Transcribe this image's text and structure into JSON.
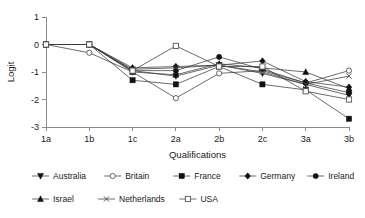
{
  "chart_data": {
    "type": "line",
    "title": "",
    "xlabel": "Qualifications",
    "ylabel": "Logit",
    "categories": [
      "1a",
      "1b",
      "1c",
      "2a",
      "2b",
      "2c",
      "3a",
      "3b"
    ],
    "ylim": [
      -3,
      1
    ],
    "yticks": [
      1,
      0,
      -1,
      -2,
      -3
    ],
    "ytick_labels": [
      "1",
      "0",
      "-1",
      "-2",
      "-3"
    ],
    "grid": false,
    "legend_position": "bottom",
    "series": [
      {
        "name": "Australia",
        "marker": "triangle-down-filled",
        "values": [
          0.0,
          0.0,
          -0.95,
          -1.15,
          -0.75,
          -1.05,
          -1.45,
          -1.85
        ]
      },
      {
        "name": "Britain",
        "marker": "circle-open",
        "values": [
          0.0,
          -0.3,
          -1.0,
          -1.95,
          -1.05,
          -0.95,
          -1.4,
          -0.95
        ]
      },
      {
        "name": "France",
        "marker": "square-filled",
        "values": [
          0.0,
          0.0,
          -1.3,
          -1.45,
          -0.8,
          -1.45,
          -1.65,
          -2.7
        ]
      },
      {
        "name": "Germany",
        "marker": "diamond-filled",
        "values": [
          0.0,
          0.0,
          -0.85,
          -0.8,
          -0.75,
          -0.6,
          -1.35,
          -1.55
        ]
      },
      {
        "name": "Ireland",
        "marker": "circle-filled",
        "values": [
          0.0,
          0.0,
          -0.95,
          -0.95,
          -0.45,
          -0.9,
          -1.4,
          -1.75
        ]
      },
      {
        "name": "Israel",
        "marker": "triangle-up-filled",
        "values": [
          0.0,
          0.0,
          -1.0,
          -1.1,
          -0.7,
          -0.85,
          -1.0,
          -1.6
        ]
      },
      {
        "name": "Netherlands",
        "marker": "cross",
        "values": [
          0.0,
          0.0,
          -0.9,
          -0.85,
          -0.75,
          -1.0,
          -1.45,
          -1.15
        ]
      },
      {
        "name": "USA",
        "marker": "square-open",
        "values": [
          0.0,
          0.0,
          -0.95,
          -0.05,
          -0.8,
          -0.8,
          -1.7,
          -2.0
        ]
      }
    ]
  },
  "legend": {
    "rows": [
      [
        "Australia",
        "Britain",
        "France",
        "Germany",
        "Ireland"
      ],
      [
        "Israel",
        "Netherlands",
        "USA"
      ]
    ]
  },
  "colors": {
    "axis": "#8c8c8c",
    "line": "#3b3b3b",
    "marker_fill": "#111111",
    "marker_open_fill": "#ffffff",
    "text": "#1a1a1a",
    "background": "#ffffff"
  }
}
